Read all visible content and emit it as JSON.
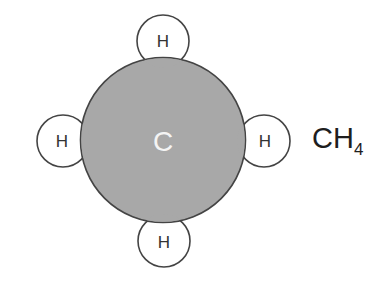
{
  "molecule": {
    "name": "methane",
    "formula_main": "CH",
    "formula_subscript": "4",
    "central_atom": {
      "label": "C",
      "fill_color": "#a8a8a8",
      "label_color": "#f4f4f4"
    },
    "hydrogen_atoms": [
      {
        "position": "top",
        "label": "H"
      },
      {
        "position": "left",
        "label": "H"
      },
      {
        "position": "right",
        "label": "H"
      },
      {
        "position": "bottom",
        "label": "H"
      }
    ],
    "outline_color": "#444444",
    "hydrogen_fill": "#ffffff"
  }
}
